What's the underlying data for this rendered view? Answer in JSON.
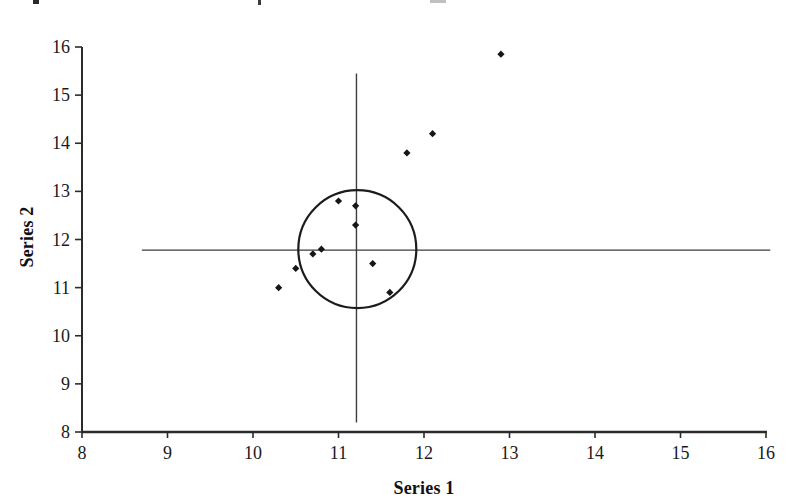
{
  "chart_data": {
    "type": "scatter",
    "title": "",
    "xlabel": "Series 1",
    "ylabel": "Series 2",
    "xlim": [
      8,
      16
    ],
    "ylim": [
      8,
      16
    ],
    "x_ticks": [
      8,
      9,
      10,
      11,
      12,
      13,
      14,
      15,
      16
    ],
    "y_ticks": [
      8,
      9,
      10,
      11,
      12,
      13,
      14,
      15,
      16
    ],
    "grid": false,
    "legend": "none",
    "marker": "diamond",
    "marker_color": "#161616",
    "axis_color": "#2b2b2b",
    "line_color": "#3d3d3d",
    "points": [
      {
        "x": 10.3,
        "y": 11.0
      },
      {
        "x": 10.5,
        "y": 11.4
      },
      {
        "x": 10.7,
        "y": 11.7
      },
      {
        "x": 10.8,
        "y": 11.8
      },
      {
        "x": 11.0,
        "y": 12.8
      },
      {
        "x": 11.2,
        "y": 12.7
      },
      {
        "x": 11.2,
        "y": 12.3
      },
      {
        "x": 11.4,
        "y": 11.5
      },
      {
        "x": 11.6,
        "y": 10.9
      },
      {
        "x": 11.8,
        "y": 13.8
      },
      {
        "x": 12.1,
        "y": 14.2
      },
      {
        "x": 12.9,
        "y": 15.85
      }
    ],
    "annotations": {
      "vertical_line": {
        "x": 11.21,
        "y_from": 8.2,
        "y_to": 15.45
      },
      "horizontal_line": {
        "y": 11.78,
        "x_from": 8.7,
        "x_to": 16.05
      },
      "circle": {
        "center_x": 11.22,
        "center_y": 11.8,
        "radius_px": 59
      }
    }
  }
}
